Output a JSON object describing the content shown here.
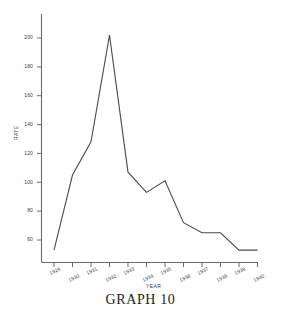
{
  "caption": "GRAPH  10",
  "chart_data": {
    "type": "line",
    "title": "GRAPH 10",
    "xlabel": "YEAR",
    "ylabel": "RATE",
    "x": [
      1929,
      1930,
      1931,
      1932,
      1933,
      1934,
      1935,
      1936,
      1937,
      1938,
      1939,
      1940
    ],
    "categories": [
      "1929",
      "1930",
      "1931",
      "1932",
      "1933",
      "1934",
      "1935",
      "1936",
      "1937",
      "1938",
      "1939",
      "1940"
    ],
    "values": [
      53,
      105,
      128,
      202,
      107,
      93,
      101,
      72,
      65,
      65,
      53,
      53
    ],
    "series": [
      {
        "name": "RATE",
        "values": [
          53,
          105,
          128,
          202,
          107,
          93,
          101,
          72,
          65,
          65,
          53,
          53
        ]
      }
    ],
    "yticks": [
      60,
      80,
      100,
      120,
      140,
      160,
      180,
      200
    ],
    "ytick_labels": [
      "60",
      "80",
      "100",
      "120",
      "140",
      "160",
      "180",
      "200"
    ],
    "xtick_labels": [
      "1929",
      "1930",
      "1931",
      "1932",
      "1933",
      "1934",
      "1935",
      "1936",
      "1937",
      "1938",
      "1939",
      "1940"
    ],
    "ylim": [
      46,
      212
    ],
    "xlim": [
      1928.6,
      1940.6
    ],
    "grid": false,
    "legend": "none",
    "line_color": "#4a4a4a",
    "axis_color": "#6b6b6b",
    "text_color": "#3a3a3a"
  }
}
